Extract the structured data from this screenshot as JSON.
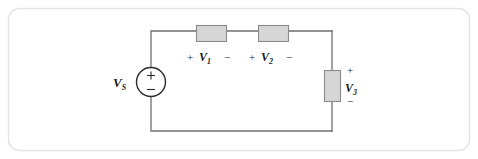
{
  "figure": {
    "type": "circuit-schematic",
    "frame": {
      "border_color": "#e3e3e3",
      "corner_radius": "10",
      "background": "#ffffff"
    },
    "style": {
      "wire_color": "#6f6f6f",
      "component_fill": "#d6d6d6",
      "component_stroke": "#8a8a8a",
      "text_color": "#1a1a1a"
    },
    "source": {
      "name": "voltage-source",
      "label": "V",
      "subscript": "S",
      "plus_sign": "+",
      "minus_sign": "−",
      "shape": "circle"
    },
    "elements": [
      {
        "id": "r1",
        "name": "resistor-v1",
        "label": "V",
        "subscript": "1",
        "plus_sign": "+",
        "minus_sign": "−",
        "orientation": "horizontal",
        "polarity_position": "below"
      },
      {
        "id": "r2",
        "name": "resistor-v2",
        "label": "V",
        "subscript": "2",
        "plus_sign": "+",
        "minus_sign": "−",
        "orientation": "horizontal",
        "polarity_position": "below"
      },
      {
        "id": "r3",
        "name": "resistor-v3",
        "label": "V",
        "subscript": "3",
        "plus_sign": "+",
        "minus_sign": "−",
        "orientation": "vertical",
        "polarity_position": "right"
      }
    ]
  }
}
